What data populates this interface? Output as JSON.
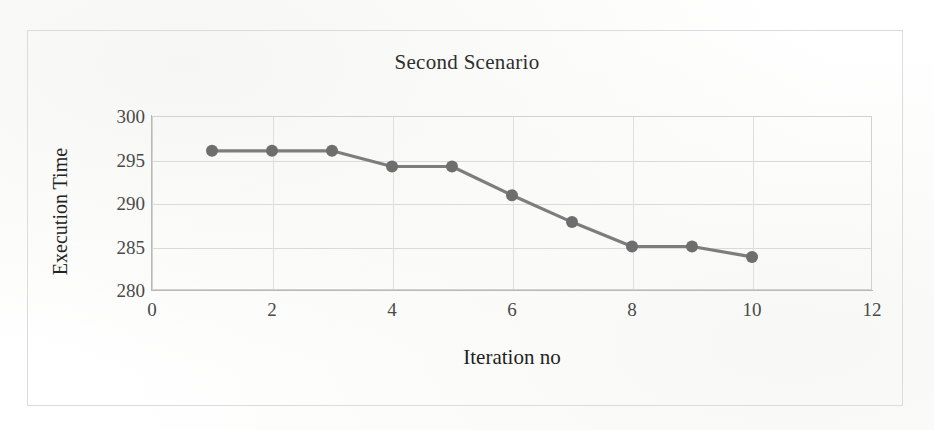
{
  "figure": {
    "background_color": "#ffffff",
    "frame_color": "#dcdcdc"
  },
  "chart_data": {
    "type": "line",
    "title": "Second Scenario",
    "xlabel": "Iteration no",
    "ylabel": "Execution Time",
    "x": [
      1,
      2,
      3,
      4,
      5,
      6,
      7,
      8,
      9,
      10
    ],
    "values": [
      296.0,
      296.0,
      296.0,
      294.2,
      294.2,
      290.9,
      287.8,
      285.0,
      285.0,
      283.8
    ],
    "series": [
      {
        "name": "Execution Time",
        "values": [
          296.0,
          296.0,
          296.0,
          294.2,
          294.2,
          290.9,
          287.8,
          285.0,
          285.0,
          283.8
        ],
        "color": "#7d7d7d",
        "marker": "circle",
        "marker_color": "#6e6e6e"
      }
    ],
    "xlim": [
      0,
      12
    ],
    "ylim": [
      280,
      300
    ],
    "xticks": [
      0,
      2,
      4,
      6,
      8,
      10,
      12
    ],
    "yticks": [
      300,
      295,
      290,
      285,
      280
    ],
    "xtick_labels": [
      "0",
      "2",
      "4",
      "6",
      "8",
      "10",
      "12"
    ],
    "ytick_labels": [
      "300",
      "295",
      "290",
      "285",
      "280"
    ],
    "grid": true,
    "grid_color": "#dadada",
    "legend": false,
    "legend_position": "none"
  }
}
